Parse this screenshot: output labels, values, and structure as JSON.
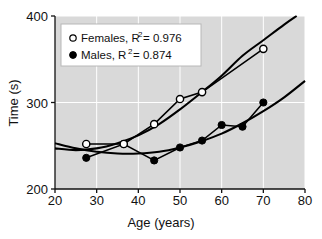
{
  "chart_data": {
    "type": "scatter",
    "title": "",
    "xlabel": "Age (years)",
    "ylabel": "Time (s)",
    "xlim": [
      20,
      80
    ],
    "ylim": [
      200,
      400
    ],
    "xticks": [
      "20",
      "30",
      "40",
      "50",
      "60",
      "70",
      "80"
    ],
    "yticks": [
      "200",
      "300",
      "400"
    ],
    "xtick_values": [
      20,
      30,
      40,
      50,
      60,
      70,
      80
    ],
    "ytick_values": [
      200,
      300,
      400
    ],
    "grid": true,
    "grid_color": "#ffffff",
    "plot_background": "#d9d9d9",
    "legend_position": "upper left",
    "series": [
      {
        "name": "Females",
        "marker": "open-circle",
        "r_squared": "0.976",
        "legend_label": "Females, R",
        "legend_exponent": "2",
        "legend_value": "= 0.976",
        "color": "#000000",
        "points": [
          {
            "x": 27.5,
            "y": 252
          },
          {
            "x": 36.5,
            "y": 252
          },
          {
            "x": 43.8,
            "y": 275
          },
          {
            "x": 50.0,
            "y": 304
          },
          {
            "x": 55.3,
            "y": 312
          },
          {
            "x": 70.0,
            "y": 362
          }
        ],
        "fit_curve": [
          {
            "x": 20.0,
            "y": 247
          },
          {
            "x": 25.0,
            "y": 245
          },
          {
            "x": 30.0,
            "y": 247
          },
          {
            "x": 35.0,
            "y": 253
          },
          {
            "x": 40.0,
            "y": 262
          },
          {
            "x": 45.0,
            "y": 275
          },
          {
            "x": 50.0,
            "y": 292
          },
          {
            "x": 55.0,
            "y": 311
          },
          {
            "x": 60.0,
            "y": 331
          },
          {
            "x": 65.0,
            "y": 354
          },
          {
            "x": 70.0,
            "y": 372
          },
          {
            "x": 75.0,
            "y": 390
          },
          {
            "x": 78.0,
            "y": 400
          }
        ]
      },
      {
        "name": "Males",
        "marker": "filled-circle",
        "r_squared": "0.874",
        "legend_label": "Males, R",
        "legend_exponent": "2",
        "legend_value": "= 0.874",
        "color": "#000000",
        "points": [
          {
            "x": 27.5,
            "y": 236
          },
          {
            "x": 36.5,
            "y": 252
          },
          {
            "x": 43.8,
            "y": 233
          },
          {
            "x": 50.0,
            "y": 248
          },
          {
            "x": 55.3,
            "y": 256
          },
          {
            "x": 60.0,
            "y": 274
          },
          {
            "x": 65.0,
            "y": 272
          },
          {
            "x": 70.0,
            "y": 300
          }
        ],
        "fit_curve": [
          {
            "x": 20.0,
            "y": 253
          },
          {
            "x": 25.0,
            "y": 247
          },
          {
            "x": 30.0,
            "y": 243
          },
          {
            "x": 35.0,
            "y": 241
          },
          {
            "x": 40.0,
            "y": 241
          },
          {
            "x": 45.0,
            "y": 243
          },
          {
            "x": 50.0,
            "y": 248
          },
          {
            "x": 55.0,
            "y": 255
          },
          {
            "x": 60.0,
            "y": 264
          },
          {
            "x": 65.0,
            "y": 276
          },
          {
            "x": 70.0,
            "y": 290
          },
          {
            "x": 75.0,
            "y": 306
          },
          {
            "x": 80.0,
            "y": 325
          }
        ]
      }
    ]
  }
}
